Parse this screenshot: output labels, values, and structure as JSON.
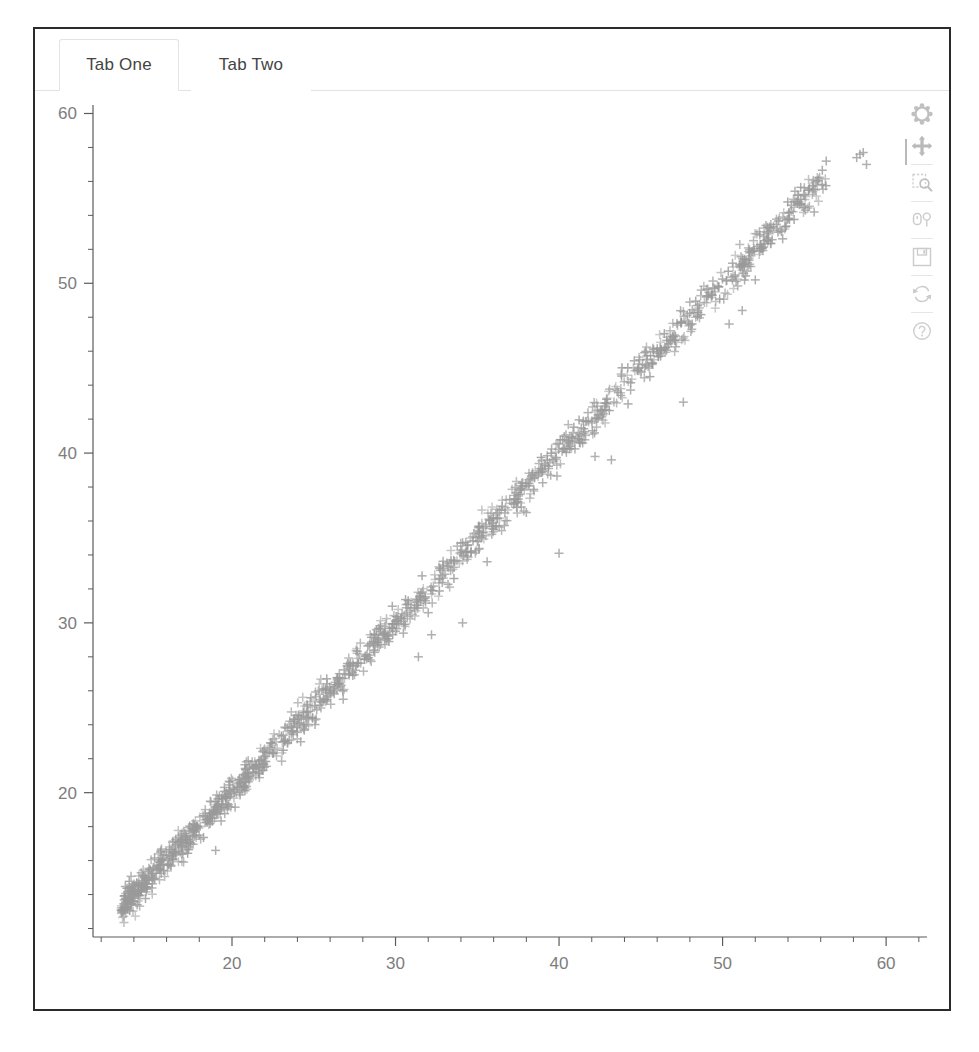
{
  "window": {
    "title": "Bokeh Tabs Panel"
  },
  "tabs": [
    {
      "label": "Tab One",
      "active": true
    },
    {
      "label": "Tab Two",
      "active": false
    }
  ],
  "toolbar": {
    "items": [
      {
        "icon": "bokeh-logo-icon",
        "label": "Bokeh"
      },
      {
        "icon": "pan-icon",
        "label": "Pan"
      },
      {
        "icon": "box-zoom-icon",
        "label": "Box Zoom"
      },
      {
        "icon": "hover-icon",
        "label": "Hover"
      },
      {
        "icon": "save-icon",
        "label": "Save"
      },
      {
        "icon": "reset-icon",
        "label": "Reset"
      },
      {
        "icon": "help-icon",
        "label": "Help"
      }
    ]
  },
  "chart_data": {
    "type": "scatter",
    "title": "",
    "xlabel": "",
    "ylabel": "",
    "xlim": [
      11.5,
      62.5
    ],
    "ylim": [
      11.5,
      60.5
    ],
    "grid": false,
    "legend": null,
    "marker": "cross",
    "marker_color": "#9a9a9a",
    "marker_size": 9,
    "xticks": [
      20,
      30,
      40,
      50,
      60
    ],
    "yticks": [
      20,
      30,
      40,
      50,
      60
    ],
    "x_minor_tick_step": 2,
    "y_minor_tick_step": 2,
    "axis_color": "#5b5b5b",
    "tick_label_color": "#7d7d7d",
    "series": [
      {
        "name": "main",
        "description": "Dense near-linear band y ~= x with small scatter",
        "n_points": 1400,
        "trend": {
          "slope": 1.0,
          "intercept": 0.0,
          "noise_sd": 0.45
        },
        "x_range": [
          13.2,
          56.4
        ]
      },
      {
        "name": "outliers",
        "description": "Scattered points below the main band plus a high cluster",
        "points": [
          [
            19.0,
            16.6
          ],
          [
            22.5,
            22.3
          ],
          [
            24.2,
            23.0
          ],
          [
            24.6,
            25.2
          ],
          [
            26.8,
            25.5
          ],
          [
            29.6,
            28.9
          ],
          [
            31.4,
            28.0
          ],
          [
            32.2,
            29.3
          ],
          [
            32.0,
            30.6
          ],
          [
            34.1,
            30.0
          ],
          [
            35.6,
            33.6
          ],
          [
            40.0,
            34.1
          ],
          [
            38.0,
            36.5
          ],
          [
            43.2,
            39.6
          ],
          [
            42.2,
            39.8
          ],
          [
            47.6,
            43.0
          ],
          [
            50.4,
            47.6
          ],
          [
            51.2,
            48.4
          ],
          [
            52.0,
            50.2
          ],
          [
            55.6,
            54.2
          ],
          [
            58.4,
            57.6
          ],
          [
            58.2,
            57.4
          ],
          [
            58.6,
            57.7
          ],
          [
            58.8,
            57.0
          ],
          [
            54.6,
            54.8
          ],
          [
            54.2,
            54.6
          ],
          [
            13.5,
            13.3
          ],
          [
            14.2,
            13.4
          ]
        ]
      }
    ]
  }
}
